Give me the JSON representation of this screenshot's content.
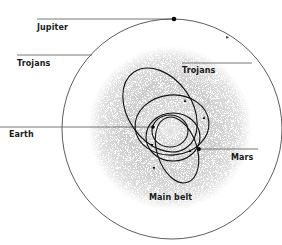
{
  "diagram": {
    "type": "solar-system-orbit-diagram",
    "labels": {
      "jupiter": "Jupiter",
      "trojans_left": "Trojans",
      "trojans_right": "Trojans",
      "earth": "Earth",
      "mars": "Mars",
      "main_belt": "Main belt"
    },
    "colors": {
      "line": "#333333",
      "orbit": "#1a1a1a",
      "belt_stipple": "#9a9a9a",
      "background": "#ffffff"
    }
  }
}
